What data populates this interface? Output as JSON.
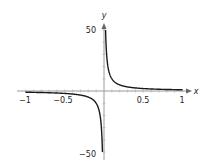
{
  "chart_data": {
    "type": "line",
    "function": "y = 1/x",
    "title": "",
    "xlabel": "x",
    "ylabel": "y",
    "xlim": [
      -1,
      1
    ],
    "ylim": [
      -50,
      50
    ],
    "x_tick_labels": [
      "-1",
      "-0.5",
      "0.5",
      "1"
    ],
    "x_ticks": [
      -1,
      -0.5,
      0.5,
      1
    ],
    "y_tick_labels": [
      "50",
      "-50"
    ],
    "y_ticks": [
      50,
      -50
    ],
    "grid": false,
    "legend": null,
    "series": [
      {
        "name": "right branch",
        "x": [
          0.02,
          0.025,
          0.03,
          0.04,
          0.05,
          0.075,
          0.1,
          0.15,
          0.2,
          0.3,
          0.4,
          0.5,
          0.6,
          0.7,
          0.8,
          0.9,
          1.0
        ],
        "y": [
          50,
          40,
          33.3,
          25,
          20,
          13.3,
          10,
          6.67,
          5,
          3.33,
          2.5,
          2,
          1.67,
          1.43,
          1.25,
          1.11,
          1
        ]
      },
      {
        "name": "left branch",
        "x": [
          -1.0,
          -0.9,
          -0.8,
          -0.7,
          -0.6,
          -0.5,
          -0.4,
          -0.3,
          -0.2,
          -0.15,
          -0.1,
          -0.075,
          -0.05,
          -0.04,
          -0.03,
          -0.025,
          -0.02
        ],
        "y": [
          -1,
          -1.11,
          -1.25,
          -1.43,
          -1.67,
          -2,
          -2.5,
          -3.33,
          -5,
          -6.67,
          -10,
          -13.3,
          -20,
          -25,
          -33.3,
          -40,
          -50
        ]
      }
    ]
  },
  "labels": {
    "x_axis": "x",
    "y_axis": "y",
    "x_neg1": "−1",
    "x_neg05": "−0.5",
    "x_pos05": "0.5",
    "x_pos1": "1",
    "y_pos50": "50",
    "y_neg50": "−50"
  },
  "colors": {
    "curve": "#1a1a1a",
    "axis": "#999999"
  }
}
